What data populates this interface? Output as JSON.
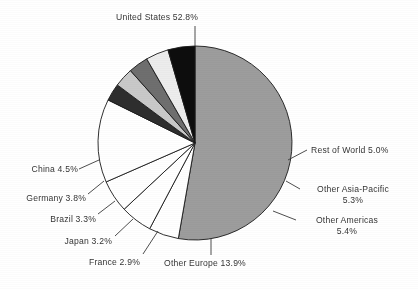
{
  "chart_data": {
    "type": "pie",
    "title": "",
    "categories": [
      "United States",
      "Rest of World",
      "Other Asia-Pacific",
      "Other Americas",
      "Other Europe",
      "France",
      "Japan",
      "Brazil",
      "Germany",
      "China"
    ],
    "values": [
      52.8,
      5.0,
      5.3,
      5.4,
      13.9,
      2.9,
      3.2,
      3.3,
      3.8,
      4.5
    ],
    "unit": "%",
    "legend": "none",
    "grid": false,
    "slices": [
      {
        "name": "United States",
        "pct": 52.8,
        "label": "United States 52.8%",
        "fill": "#9d9d9d",
        "start_deg": 0,
        "end_deg": 190.08
      },
      {
        "name": "Rest of World",
        "pct": 5.0,
        "label": "Rest of World 5.0%",
        "fill": "#ffffff",
        "start_deg": 190.08,
        "end_deg": 208.08
      },
      {
        "name": "Other Asia-Pacific",
        "pct": 5.3,
        "label": "Other Asia-Pacific",
        "pct_label": "5.3%",
        "fill": "#ffffff",
        "start_deg": 208.08,
        "end_deg": 227.16
      },
      {
        "name": "Other Americas",
        "pct": 5.4,
        "label": "Other Americas",
        "pct_label": "5.4%",
        "fill": "#ffffff",
        "start_deg": 227.16,
        "end_deg": 246.6
      },
      {
        "name": "Other Europe",
        "pct": 13.9,
        "label": "Other Europe 13.9%",
        "fill": "#ffffff",
        "start_deg": 246.6,
        "end_deg": 296.64
      },
      {
        "name": "France",
        "pct": 2.9,
        "label": "France 2.9%",
        "fill": "#2e2e2e",
        "start_deg": 296.64,
        "end_deg": 307.08
      },
      {
        "name": "Japan",
        "pct": 3.2,
        "label": "Japan 3.2%",
        "fill": "#c9c9c9",
        "start_deg": 307.08,
        "end_deg": 318.6
      },
      {
        "name": "Brazil",
        "pct": 3.3,
        "label": "Brazil 3.3%",
        "fill": "#6f6f6f",
        "start_deg": 318.6,
        "end_deg": 330.48
      },
      {
        "name": "Germany",
        "pct": 3.8,
        "label": "Germany 3.8%",
        "fill": "#ededed",
        "start_deg": 330.48,
        "end_deg": 344.16
      },
      {
        "name": "China",
        "pct": 4.5,
        "label": "China 4.5%",
        "fill": "#0d0d0d",
        "start_deg": 344.16,
        "end_deg": 360
      }
    ]
  },
  "labels": {
    "united_states": "United States 52.8%",
    "rest_of_world": "Rest of World 5.0%",
    "other_asia_pacific_name": "Other Asia-Pacific",
    "other_asia_pacific_pct": "5.3%",
    "other_americas_name": "Other Americas",
    "other_americas_pct": "5.4%",
    "other_europe": "Other Europe 13.9%",
    "france": "France 2.9%",
    "japan": "Japan 3.2%",
    "brazil": "Brazil 3.3%",
    "germany": "Germany 3.8%",
    "china": "China 4.5%"
  },
  "colors": {
    "united_states": "#9d9d9d",
    "china": "#0d0d0d",
    "germany": "#ededed",
    "brazil": "#6f6f6f",
    "japan": "#c9c9c9",
    "france": "#2e2e2e",
    "white_slices": "#ffffff",
    "outline": "#1a1a1a",
    "text": "#262626",
    "background": "#ffffff"
  }
}
